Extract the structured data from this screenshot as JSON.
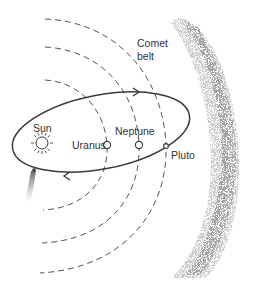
{
  "diagram": {
    "title": "",
    "labels": {
      "sun": "Sun",
      "uranus": "Uranus",
      "neptune": "Neptune",
      "pluto": "Pluto",
      "comet_belt_line1": "Comet",
      "comet_belt_line2": "belt"
    },
    "elements": {
      "sun": {
        "icon": "sun-icon",
        "x": 42,
        "y": 143
      },
      "uranus": {
        "icon": "planet-circle-icon",
        "x": 107,
        "y": 145
      },
      "neptune": {
        "icon": "planet-circle-icon",
        "x": 139,
        "y": 145
      },
      "pluto": {
        "icon": "planet-circle-icon",
        "x": 166,
        "y": 146
      },
      "comet_orbit": {
        "shape": "ellipse",
        "direction": "counter-clockwise",
        "arrows": [
          "top-right",
          "bottom-left"
        ]
      },
      "comet": {
        "icon": "comet-icon",
        "x": 34,
        "y": 170
      },
      "planet_orbits": [
        "uranus-orbit",
        "neptune-orbit",
        "pluto-orbit"
      ],
      "comet_belt_band": {
        "style": "stippled-band",
        "position": "right"
      }
    },
    "colors": {
      "line": "#3a3a3a",
      "dashed": "#555555",
      "text": "#333333",
      "stipple": "#9a9a9a"
    }
  }
}
